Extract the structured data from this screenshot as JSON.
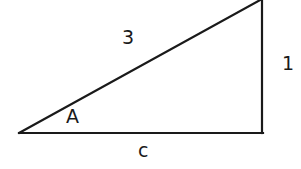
{
  "diagram": {
    "type": "right-triangle",
    "stroke_color": "#1a1a1a",
    "background": "#ffffff",
    "vertices": {
      "left": [
        19,
        133
      ],
      "right_angle": [
        262,
        133
      ],
      "top": [
        262,
        0
      ]
    },
    "labels": {
      "hypotenuse": "3",
      "opposite": "1",
      "adjacent": "c",
      "angle": "A"
    }
  }
}
